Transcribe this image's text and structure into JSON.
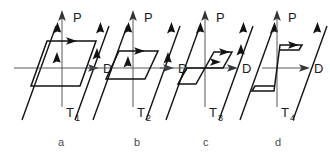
{
  "figure": {
    "title": "",
    "background_color": "#ffffff",
    "line_color": "#101214",
    "axis_color": "#55585c",
    "width": 330,
    "height": 159
  },
  "axes": {
    "vertical_label": "P",
    "horizontal_label": "D"
  },
  "panels": [
    {
      "id": "a",
      "letter": "a",
      "temperature_label": "T",
      "temperature_subscript": "1",
      "p_label": "P",
      "d_label": "D",
      "origin_x": 62,
      "origin_y": 68,
      "loop_description": "wide sheared parallelogram hysteresis loop centred on origin",
      "loop_points": "31,86 47,41 96,41 80,86",
      "guides": [
        "22,120 56,26",
        "75,120 109,26"
      ],
      "flow_arrows": [
        {
          "x": 72,
          "y": 41,
          "dir": "right"
        },
        {
          "x": 56,
          "y": 60,
          "dir": "up-right"
        },
        {
          "x": 95,
          "y": 55,
          "dir": "up-right"
        },
        {
          "x": 57,
          "y": 27,
          "dir": "up-right"
        },
        {
          "x": 100,
          "y": 27,
          "dir": "up-right"
        }
      ]
    },
    {
      "id": "b",
      "letter": "b",
      "temperature_label": "T",
      "temperature_subscript": "2",
      "p_label": "P",
      "d_label": "D",
      "origin_x": 133,
      "origin_y": 68,
      "loop_description": "narrower sheared parallelogram hysteresis loop centred on origin",
      "loop_points": "106,79 119,51 158,51 145,79",
      "guides": [
        "93,120 127,26",
        "146,120 180,26"
      ],
      "flow_arrows": [
        {
          "x": 140,
          "y": 51,
          "dir": "right"
        },
        {
          "x": 127,
          "y": 64,
          "dir": "up-right"
        },
        {
          "x": 166,
          "y": 58,
          "dir": "up-right"
        },
        {
          "x": 128,
          "y": 27,
          "dir": "up-right"
        },
        {
          "x": 171,
          "y": 27,
          "dir": "up-right"
        }
      ]
    },
    {
      "id": "c",
      "letter": "c",
      "temperature_label": "T",
      "temperature_subscript": "3",
      "p_label": "P",
      "d_label": "D",
      "origin_x": 205,
      "origin_y": 68,
      "loop_description": "double-step offset loop, small parallelogram above-right and below-left of origin",
      "loop_points_upper": "205,68 214,52 232,52 223,68",
      "loop_points_lower": "205,68 196,84 178,84 187,68",
      "guides": [
        "166,120 200,26",
        "219,120 253,26"
      ],
      "flow_arrows": [
        {
          "x": 226,
          "y": 45,
          "dir": "right"
        },
        {
          "x": 215,
          "y": 60,
          "dir": "right"
        },
        {
          "x": 200,
          "y": 27,
          "dir": "up-right"
        },
        {
          "x": 243,
          "y": 27,
          "dir": "up-right"
        },
        {
          "x": 239,
          "y": 50,
          "dir": "up-right"
        }
      ]
    },
    {
      "id": "d",
      "letter": "d",
      "temperature_label": "T",
      "temperature_subscript": "4",
      "p_label": "P",
      "d_label": "D",
      "origin_x": 277,
      "origin_y": 68,
      "loop_description": "very narrow nearly-vertical stepped loop with flat horizontal shelves",
      "loop_points_upper": "277,68 280,45 302,45 299,50 279,50",
      "loop_points_lower": "277,68 274,91 252,91 255,86 275,86",
      "guides": [
        "240,120 274,26",
        "293,120 327,26"
      ],
      "flow_arrows": [
        {
          "x": 292,
          "y": 45,
          "dir": "right"
        },
        {
          "x": 274,
          "y": 27,
          "dir": "up-right"
        },
        {
          "x": 317,
          "y": 27,
          "dir": "up-right"
        }
      ]
    }
  ]
}
